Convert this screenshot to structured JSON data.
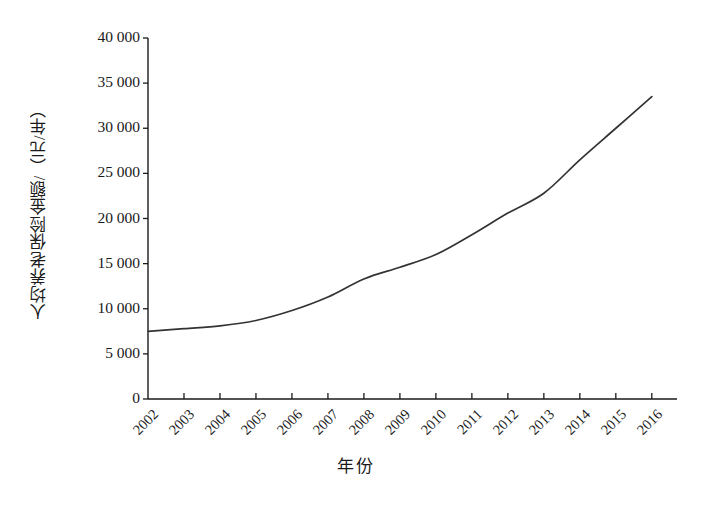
{
  "chart_data": {
    "type": "line",
    "title": "",
    "xlabel": "年份",
    "ylabel": "人均养老保险金额/（元/年）",
    "x": [
      2002,
      2003,
      2004,
      2005,
      2006,
      2007,
      2008,
      2009,
      2010,
      2011,
      2012,
      2013,
      2014,
      2015,
      2016
    ],
    "categories": [
      "2002",
      "2003",
      "2004",
      "2005",
      "2006",
      "2007",
      "2008",
      "2009",
      "2010",
      "2011",
      "2012",
      "2013",
      "2014",
      "2015",
      "2016"
    ],
    "values": [
      7500,
      7800,
      8100,
      8700,
      9800,
      11300,
      13300,
      14600,
      16000,
      18200,
      20600,
      22800,
      26500,
      30000,
      33500
    ],
    "series": [
      {
        "name": "人均养老保险金额",
        "values": [
          7500,
          7800,
          8100,
          8700,
          9800,
          11300,
          13300,
          14600,
          16000,
          18200,
          20600,
          22800,
          26500,
          30000,
          33500
        ]
      }
    ],
    "ylim": [
      0,
      40000
    ],
    "yticks": [
      0,
      5000,
      10000,
      15000,
      20000,
      25000,
      30000,
      35000,
      40000
    ],
    "ytick_labels": [
      "0",
      "5 000",
      "10 000",
      "15 000",
      "20 000",
      "25 000",
      "30 000",
      "35 000",
      "40 000"
    ],
    "xlim": [
      2002,
      2016.7
    ],
    "grid": false,
    "legend": false,
    "line_color": "#333333",
    "axis_color": "#1a1a1a",
    "background_color": "#ffffff"
  }
}
